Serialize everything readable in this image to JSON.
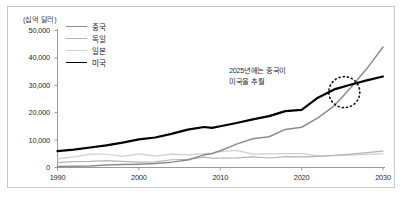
{
  "chart_data": {
    "type": "line",
    "title": "",
    "subtitle": "",
    "unit_label": "(십억 달러)",
    "xlabel": "",
    "ylabel": "",
    "xlim": [
      1990,
      2030
    ],
    "ylim": [
      0,
      50000
    ],
    "xticks": [
      "1990",
      "2000",
      "2010",
      "2020",
      "2030"
    ],
    "xtick_values": [
      1990,
      2000,
      2010,
      2020,
      2030
    ],
    "yticks": [
      "0",
      "10,000",
      "20,000",
      "30,000",
      "40,000",
      "50,000"
    ],
    "ytick_values": [
      0,
      10000,
      20000,
      30000,
      40000,
      50000
    ],
    "grid": false,
    "legend_position": "top-left-inside",
    "x": [
      1990,
      1992,
      1994,
      1996,
      1998,
      2000,
      2002,
      2004,
      2006,
      2008,
      2009,
      2010,
      2012,
      2014,
      2016,
      2018,
      2020,
      2022,
      2024,
      2026,
      2028,
      2030
    ],
    "series": [
      {
        "name": "중국",
        "color": "#8c8c8c",
        "width": 1.5,
        "values": [
          400,
          500,
          570,
          880,
          1050,
          1220,
          1480,
          1960,
          2760,
          4600,
          5120,
          6090,
          8530,
          10480,
          11230,
          13890,
          14690,
          18100,
          22500,
          29000,
          36000,
          44000
        ]
      },
      {
        "name": "독일",
        "color": "#b5b5b5",
        "width": 1.2,
        "values": [
          1770,
          2130,
          2210,
          2510,
          2240,
          1950,
          2080,
          2820,
          3000,
          3750,
          3420,
          3400,
          3540,
          3890,
          3470,
          3970,
          3890,
          4080,
          4400,
          4900,
          5400,
          6000
        ]
      },
      {
        "name": "일본",
        "color": "#cfcfcf",
        "width": 1.2,
        "values": [
          3130,
          3910,
          4910,
          4830,
          4030,
          4970,
          4180,
          4890,
          4600,
          5100,
          5290,
          5760,
          6270,
          4900,
          5000,
          5040,
          5060,
          4230,
          4300,
          4550,
          4800,
          5000
        ]
      },
      {
        "name": "미국",
        "color": "#000000",
        "width": 2.2,
        "values": [
          5960,
          6520,
          7310,
          8100,
          9060,
          10250,
          10940,
          12270,
          13820,
          14770,
          14480,
          15050,
          16250,
          17550,
          18750,
          20580,
          21060,
          25460,
          28500,
          30200,
          31800,
          33200
        ]
      }
    ],
    "annotations": [
      {
        "name": "crossover-note",
        "line1": "2025년에는 중국이",
        "line2": "미국을 추월",
        "x": 2025,
        "highlight": "dotted-circle"
      }
    ]
  }
}
